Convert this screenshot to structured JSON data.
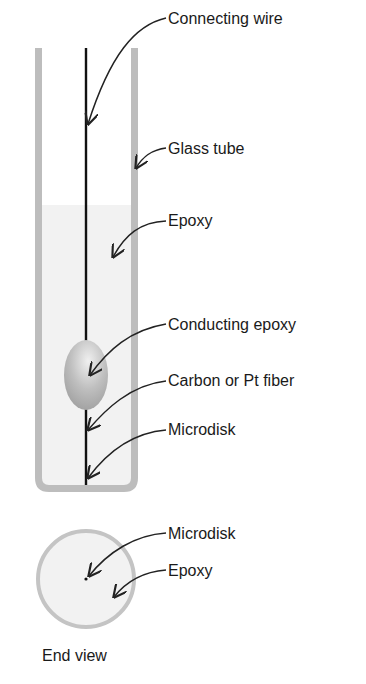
{
  "diagram": {
    "side_view_labels": [
      {
        "id": "connecting-wire",
        "text": "Connecting wire",
        "x": 168,
        "y": 11
      },
      {
        "id": "glass-tube",
        "text": "Glass tube",
        "x": 168,
        "y": 141
      },
      {
        "id": "epoxy",
        "text": "Epoxy",
        "x": 168,
        "y": 213
      },
      {
        "id": "conducting-epoxy",
        "text": "Conducting epoxy",
        "x": 168,
        "y": 317
      },
      {
        "id": "carbon-pt-fiber",
        "text": "Carbon or Pt fiber",
        "x": 168,
        "y": 373
      },
      {
        "id": "microdisk",
        "text": "Microdisk",
        "x": 168,
        "y": 422
      }
    ],
    "end_view_labels": [
      {
        "id": "end-microdisk",
        "text": "Microdisk",
        "x": 168,
        "y": 526
      },
      {
        "id": "end-epoxy",
        "text": "Epoxy",
        "x": 168,
        "y": 563
      }
    ],
    "end_view_caption": "End view",
    "colors": {
      "glass": "#bdbdbd",
      "epoxy_fill": "#f2f2f2",
      "wire": "#111111",
      "text": "#1a1a1a"
    }
  }
}
